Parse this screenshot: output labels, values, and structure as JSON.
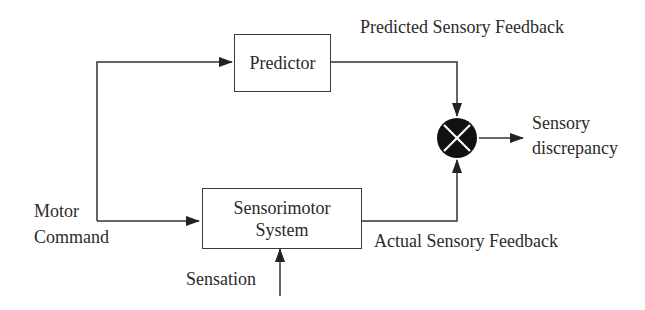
{
  "diagram": {
    "title_labels": {
      "predicted_feedback": "Predicted Sensory Feedback",
      "actual_feedback": "Actual Sensory Feedback",
      "motor_command_line1": "Motor",
      "motor_command_line2": "Command",
      "sensation": "Sensation",
      "discrepancy_line1": "Sensory",
      "discrepancy_line2": "discrepancy"
    },
    "blocks": {
      "predictor": "Predictor",
      "sensorimotor_line1": "Sensorimotor",
      "sensorimotor_line2": "System"
    },
    "comparator": {
      "symbol": "comparator-x-icon",
      "fill": "#111111"
    },
    "colors": {
      "line": "#333333",
      "text": "#2b2b2b"
    }
  }
}
